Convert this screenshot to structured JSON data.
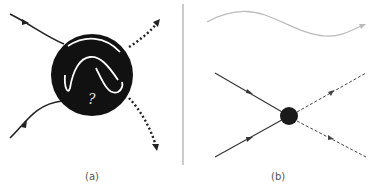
{
  "panels": [
    {
      "id": "a",
      "label": "(a)",
      "description": "Two incoming solid particle lines enter a black blob containing white wavy curves and a question mark; two dotted arrows exit",
      "blob_symbol": "?"
    },
    {
      "id": "b",
      "label": "(b)",
      "description": "Feynman-style vertex: two incoming solid lines with arrows meet at a black dot; two dashed outgoing lines with arrows; grey wavy line above"
    }
  ],
  "colors": {
    "blob": "#111111",
    "line": "#222222",
    "wave": "#bbbbbb",
    "divider": "#999999",
    "label": "#555555"
  }
}
